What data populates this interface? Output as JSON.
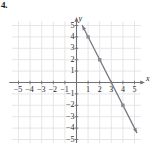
{
  "figure": {
    "exercise_number": "4.",
    "x_axis_name": "x",
    "y_axis_name": "y"
  },
  "chart_data": {
    "type": "line",
    "title": "",
    "xlabel": "x",
    "ylabel": "y",
    "xlim": [
      -5.8,
      5.8
    ],
    "ylim": [
      -5.5,
      5.5
    ],
    "grid": true,
    "legend": "none",
    "x_ticks": [
      -5,
      -4,
      -3,
      -2,
      -1,
      1,
      2,
      3,
      4,
      5
    ],
    "y_ticks": [
      -5,
      -4,
      -3,
      -2,
      -1,
      1,
      2,
      3,
      4,
      5
    ],
    "x_tick_labels": [
      "-5",
      "-4",
      "-3",
      "-2",
      "-1",
      "1",
      "2",
      "3",
      "4",
      "5"
    ],
    "y_tick_labels": [
      "-5",
      "-4",
      "-3",
      "-2",
      "-1",
      "1",
      "2",
      "3",
      "4",
      "5"
    ],
    "series": [
      {
        "name": "line",
        "equation": "y = -2x + 6",
        "slope": -2,
        "y_intercept": 6,
        "x_intercept": 3,
        "color": "#7a7a82",
        "arrows": "both",
        "x": [
          0.5,
          1,
          2,
          3,
          4,
          5.2
        ],
        "y": [
          5,
          4,
          2,
          0,
          -2,
          -4.4
        ],
        "marked_points": [
          {
            "x": 1,
            "y": 4
          },
          {
            "x": 2,
            "y": 2
          },
          {
            "x": 4,
            "y": -2
          }
        ]
      }
    ],
    "colors": {
      "grid": "#e3e3e6",
      "axis": "#6f6f75",
      "line": "#7a7a82",
      "point": "#8a8a90",
      "text": "#2b2b2b"
    }
  }
}
